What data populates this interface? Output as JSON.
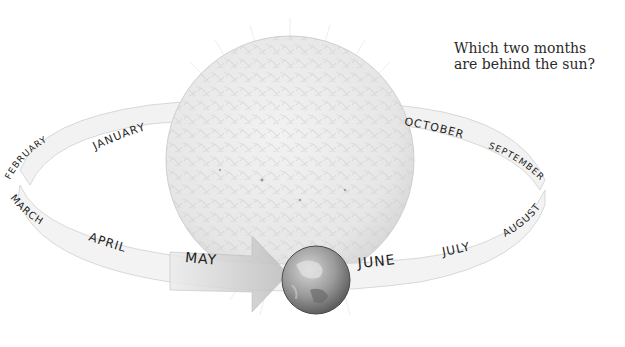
{
  "question": {
    "line1": "Which two months",
    "line2": "are behind the sun?"
  },
  "months": {
    "january": "JANUARY",
    "february": "FEBRUARY",
    "march": "MARCH",
    "april": "APRIL",
    "may": "MAY",
    "june": "JUNE",
    "july": "JULY",
    "august": "AUGUST",
    "september": "SEPTEMBER",
    "october": "OCTOBER"
  },
  "colors": {
    "background": "#ffffff",
    "ring": "#f1f1f1",
    "ring_edge": "#cfcfcf",
    "sun": "#ececec",
    "earth": "#8a8a8a",
    "text": "#1e1e1e"
  }
}
